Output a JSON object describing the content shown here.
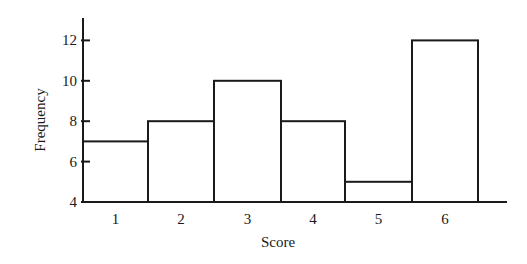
{
  "chart_data": {
    "type": "bar",
    "subtype": "histogram",
    "title": "",
    "xlabel": "Score",
    "ylabel": "Frequency",
    "categories": [
      "1",
      "2",
      "3",
      "4",
      "5",
      "6"
    ],
    "values": [
      7,
      8,
      10,
      8,
      5,
      12
    ],
    "ylim": [
      4,
      13
    ],
    "yticks": [
      "4",
      "6",
      "8",
      "10",
      "12"
    ],
    "grid": false,
    "legend": null
  },
  "colors": {
    "stroke": "#1a1a1a",
    "fill": "#ffffff"
  }
}
